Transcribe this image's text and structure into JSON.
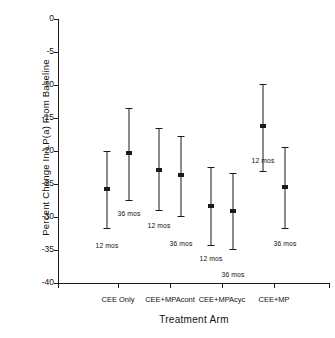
{
  "chart_data": {
    "type": "scatter",
    "title": "",
    "xlabel": "Treatment Arm",
    "ylabel": "Percent Change In LP(a) From Baseline",
    "ylim": [
      -40,
      0
    ],
    "yticks": [
      0,
      -5,
      -10,
      -15,
      -20,
      -25,
      -30,
      -35,
      -40
    ],
    "ytick_labels": [
      "0",
      "-5",
      "-10",
      "-15",
      "-20",
      "-25",
      "-30",
      "-35",
      "-40"
    ],
    "grid": false,
    "legend": "none",
    "categories": [
      "CEE Only",
      "CEE+MPAcont",
      "CEE+MPAcyc",
      "CEE+MP"
    ],
    "series": [
      {
        "name": "12 mos",
        "values": [
          -25.8,
          -22.9,
          -28.4,
          -16.2
        ],
        "ci_low": [
          -31.7,
          -29.0,
          -34.2,
          -23.0
        ],
        "ci_high": [
          -20.0,
          -16.5,
          -22.4,
          -9.8
        ]
      },
      {
        "name": "36 mos",
        "values": [
          -20.3,
          -23.7,
          -29.1,
          -25.5
        ],
        "ci_low": [
          -27.4,
          -29.9,
          -34.9,
          -31.6
        ],
        "ci_high": [
          -13.5,
          -17.8,
          -23.3,
          -19.4
        ]
      }
    ],
    "annotations": [
      {
        "text": "12 mos",
        "group": "CEE Only",
        "series": "12 mos"
      },
      {
        "text": "36 mos",
        "group": "CEE Only",
        "series": "36 mos"
      },
      {
        "text": "12 mos",
        "group": "CEE+MPAcont",
        "series": "12 mos"
      },
      {
        "text": "36 mos",
        "group": "CEE+MPAcont",
        "series": "36 mos"
      },
      {
        "text": "12 mos",
        "group": "CEE+MPAcyc",
        "series": "12 mos"
      },
      {
        "text": "36 mos",
        "group": "CEE+MPAcyc",
        "series": "36 mos"
      },
      {
        "text": "12 mos",
        "group": "CEE+MP",
        "series": "12 mos"
      },
      {
        "text": "36 mos",
        "group": "CEE+MP",
        "series": "36 mos"
      }
    ],
    "marker_color": "#1a1a1a",
    "axis_color": "#1a1a1a"
  }
}
